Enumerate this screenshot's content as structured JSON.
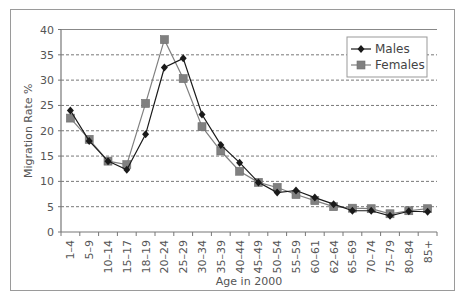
{
  "chart_data": {
    "type": "line",
    "title": "",
    "xlabel": "Age in 2000",
    "ylabel": "Migration Rate %",
    "ylim": [
      0,
      40
    ],
    "yticks": [
      0,
      5,
      10,
      15,
      20,
      25,
      30,
      35,
      40
    ],
    "grid": "horizontal dashed",
    "legend_position": "upper right",
    "categories": [
      "1–4",
      "5–9",
      "10–14",
      "15–17",
      "18–19",
      "20–24",
      "25–29",
      "30–34",
      "35–39",
      "40–44",
      "45–49",
      "50–54",
      "55–59",
      "60–61",
      "62–64",
      "65–69",
      "70–74",
      "75–79",
      "80–84",
      "85+"
    ],
    "series": [
      {
        "name": "Males",
        "marker": "diamond",
        "color": "#1a1a1a",
        "values": [
          24.0,
          18.0,
          14.0,
          12.3,
          19.3,
          32.5,
          34.3,
          23.2,
          17.2,
          13.7,
          9.8,
          7.8,
          8.2,
          6.8,
          5.5,
          4.2,
          4.2,
          3.2,
          4.1,
          4.0
        ]
      },
      {
        "name": "Females",
        "marker": "square",
        "color": "#808080",
        "values": [
          22.5,
          18.3,
          14.0,
          13.3,
          25.4,
          38.0,
          30.3,
          20.8,
          16.0,
          12.0,
          9.8,
          8.8,
          7.4,
          6.2,
          5.0,
          4.7,
          4.6,
          3.6,
          4.2,
          4.6
        ]
      }
    ]
  }
}
